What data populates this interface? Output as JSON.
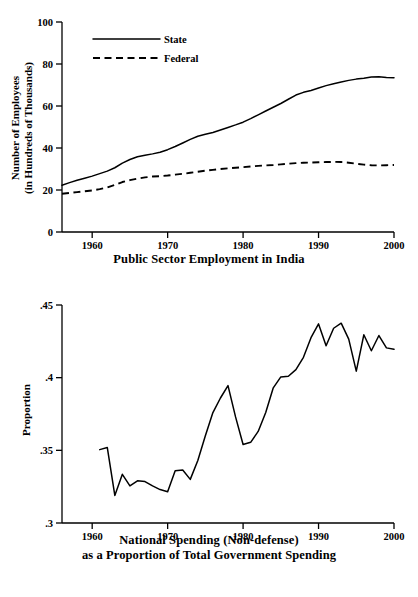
{
  "chart_data": [
    {
      "id": "public-sector-employment",
      "type": "line",
      "title": "Public Sector Employment in India",
      "xlabel": "",
      "ylabel": "Number of Employees (in Hundreds of Thousands)",
      "ylabel_line1": "Number of Employees",
      "ylabel_line2": "(in Hundreds of Thousands)",
      "xlim": [
        1956,
        2000
      ],
      "ylim": [
        0,
        100
      ],
      "xticks": [
        1960,
        1970,
        1980,
        1990,
        2000
      ],
      "xticklabels": [
        "1960",
        "1970",
        "1980",
        "1990",
        "2000"
      ],
      "yticks": [
        0,
        20,
        40,
        60,
        80,
        100
      ],
      "yticklabels": [
        "0",
        "20",
        "40",
        "60",
        "80",
        "100"
      ],
      "grid": false,
      "legend_position": "inside-upper-left",
      "legend": [
        "State",
        "Federal"
      ],
      "x": [
        1956,
        1957,
        1958,
        1959,
        1960,
        1961,
        1962,
        1963,
        1964,
        1965,
        1966,
        1967,
        1968,
        1969,
        1970,
        1971,
        1972,
        1973,
        1974,
        1975,
        1976,
        1977,
        1978,
        1979,
        1980,
        1981,
        1982,
        1983,
        1984,
        1985,
        1986,
        1987,
        1988,
        1989,
        1990,
        1991,
        1992,
        1993,
        1994,
        1995,
        1996,
        1997,
        1998,
        1999,
        2000
      ],
      "series": [
        {
          "name": "State",
          "style": "solid",
          "values": [
            22.3,
            23.5,
            24.6,
            25.6,
            26.6,
            27.8,
            29.0,
            30.6,
            32.8,
            34.5,
            35.8,
            36.5,
            37.2,
            38.0,
            39.2,
            40.7,
            42.4,
            44.1,
            45.6,
            46.5,
            47.4,
            48.6,
            49.8,
            51.0,
            52.3,
            54.0,
            55.8,
            57.6,
            59.4,
            61.2,
            63.2,
            65.2,
            66.5,
            67.4,
            68.6,
            69.7,
            70.6,
            71.4,
            72.2,
            72.8,
            73.2,
            73.8,
            73.9,
            73.6,
            73.5
          ]
        },
        {
          "name": "Federal",
          "style": "dashed",
          "values": [
            18.2,
            18.6,
            19.0,
            19.4,
            19.8,
            20.4,
            21.2,
            22.4,
            23.8,
            24.7,
            25.4,
            26.0,
            26.4,
            26.6,
            26.9,
            27.3,
            27.7,
            28.2,
            28.7,
            29.2,
            29.6,
            30.0,
            30.3,
            30.6,
            30.9,
            31.2,
            31.5,
            31.7,
            31.9,
            32.2,
            32.5,
            32.8,
            33.0,
            33.1,
            33.2,
            33.3,
            33.4,
            33.3,
            33.0,
            32.5,
            32.1,
            31.8,
            31.7,
            31.8,
            31.9
          ]
        }
      ]
    },
    {
      "id": "national-spending-proportion",
      "type": "line",
      "title": "National Spending (Non-defense) as a Proportion of Total Government Spending",
      "title_line1": "National Spending (Non-defense)",
      "title_line2": "as a Proportion of Total Government Spending",
      "xlabel": "",
      "ylabel": "Proportion",
      "xlim": [
        1956,
        2000
      ],
      "ylim": [
        0.3,
        0.45
      ],
      "xticks": [
        1960,
        1970,
        1980,
        1990,
        2000
      ],
      "xticklabels": [
        "1960",
        "1970",
        "1980",
        "1990",
        "2000"
      ],
      "yticks": [
        0.3,
        0.35,
        0.4,
        0.45
      ],
      "yticklabels": [
        ".3",
        ".35",
        ".4",
        ".45"
      ],
      "grid": false,
      "legend_position": "none",
      "legend": [],
      "x": [
        1961,
        1962,
        1963,
        1964,
        1965,
        1966,
        1967,
        1968,
        1969,
        1970,
        1971,
        1972,
        1973,
        1974,
        1975,
        1976,
        1977,
        1978,
        1979,
        1980,
        1981,
        1982,
        1983,
        1984,
        1985,
        1986,
        1987,
        1988,
        1989,
        1990,
        1991,
        1992,
        1993,
        1994,
        1995,
        1996,
        1997,
        1998,
        1999,
        2000
      ],
      "series": [
        {
          "name": "Proportion",
          "style": "solid",
          "values": [
            0.3505,
            0.352,
            0.319,
            0.3335,
            0.3255,
            0.329,
            0.3285,
            0.3255,
            0.323,
            0.3215,
            0.336,
            0.3365,
            0.33,
            0.343,
            0.36,
            0.376,
            0.386,
            0.3945,
            0.373,
            0.354,
            0.3555,
            0.363,
            0.376,
            0.393,
            0.4005,
            0.401,
            0.4055,
            0.414,
            0.4275,
            0.437,
            0.422,
            0.434,
            0.4375,
            0.4265,
            0.4045,
            0.4295,
            0.4185,
            0.429,
            0.4205,
            0.4195
          ]
        }
      ]
    }
  ],
  "chart_top": {
    "ylabel_line1": "Number of Employees",
    "ylabel_line2": "(in Hundreds of Thousands)",
    "caption": "Public Sector Employment in India",
    "legend_state": "State",
    "legend_federal": "Federal"
  },
  "chart_bottom": {
    "ylabel": "Proportion",
    "caption_line1": "National Spending (Non-defense)",
    "caption_line2": "as a Proportion of Total Government Spending"
  },
  "colors": {
    "ink": "#000000",
    "background": "#ffffff"
  }
}
